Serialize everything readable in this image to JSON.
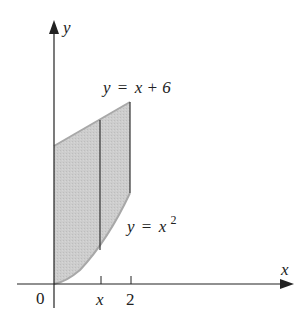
{
  "figure": {
    "colors": {
      "fill": "#c8c8c8",
      "curve": "#9a9a9a",
      "axis": "#222222",
      "text": "#222222"
    },
    "axes": {
      "x_label": "x",
      "y_label": "y",
      "origin_label": "0"
    },
    "ticks": [
      {
        "label": "x",
        "italic": true
      },
      {
        "label": "2",
        "italic": false
      }
    ],
    "curves": {
      "upper": {
        "lhs": "y",
        "eq": "=",
        "rhs": "x + 6"
      },
      "lower": {
        "lhs": "y",
        "eq": "=",
        "rhs": "x",
        "exponent": "2"
      }
    }
  }
}
